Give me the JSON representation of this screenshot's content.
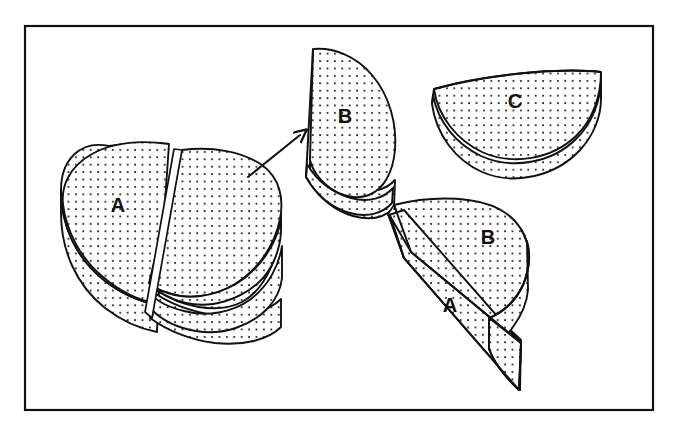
{
  "figure": {
    "domain": "diagram",
    "background_color": "#ffffff",
    "ink_color": "#111111",
    "stipple_color": "#1a1a1a",
    "border": {
      "name": "figure-frame",
      "stroke_color": "#111111",
      "stroke_width": 2.2,
      "x": 25,
      "y": 26,
      "width": 628,
      "height": 384
    },
    "arrow": {
      "name": "separation-arrow",
      "from_x": 248,
      "from_y": 177,
      "to_x": 302,
      "to_y": 134,
      "stroke_width": 2.0
    },
    "labels": [
      {
        "id": "label-a-left",
        "text": "A",
        "x": 118,
        "y": 212,
        "size": 20,
        "rotation": 0,
        "piece": "split-cylinder-left-half"
      },
      {
        "id": "label-b-top",
        "text": "B",
        "x": 345,
        "y": 123,
        "size": 20,
        "rotation": 0,
        "piece": "half-cylinder-upright"
      },
      {
        "id": "label-c-right",
        "text": "C",
        "x": 515,
        "y": 108,
        "size": 20,
        "rotation": 0,
        "piece": "half-cylinder-lying"
      },
      {
        "id": "label-b-standing",
        "text": "B",
        "x": 488,
        "y": 244,
        "size": 20,
        "rotation": 0,
        "piece": "half-cylinder-standing-top-face"
      },
      {
        "id": "label-a-standing",
        "text": "A",
        "x": 450,
        "y": 312,
        "size": 20,
        "rotation": 0,
        "piece": "half-cylinder-standing-cut-face"
      }
    ],
    "pieces": [
      {
        "name": "split-cylinder-left-half",
        "label": "A",
        "caption": "Left half of the bisected disc, top elliptical face plus curved side band"
      },
      {
        "name": "split-cylinder-right-half",
        "label": "",
        "caption": "Right half of the bisected disc, slightly displaced to the right"
      },
      {
        "name": "half-cylinder-upright",
        "label": "B",
        "caption": "Half-disc seen edge-on with flat cut face toward the left"
      },
      {
        "name": "half-cylinder-lying",
        "label": "C",
        "caption": "Half-disc lying with flat edge uppermost and curved rim below"
      },
      {
        "name": "half-cylinder-standing",
        "labels": [
          "A",
          "B"
        ],
        "caption": "Half-disc standing on its rectangular cut face, showing top face B and cut face A"
      }
    ],
    "stipple": {
      "name": "stipple-pattern",
      "dot_radius": 1.05,
      "spacing": 7.4,
      "description": "regular dotted shading fill"
    }
  }
}
